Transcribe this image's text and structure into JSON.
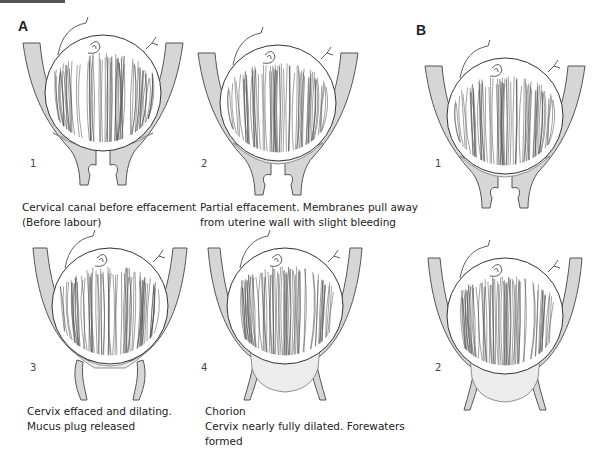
{
  "panels": {
    "A": {
      "label": "A",
      "stages": [
        {
          "number": "1",
          "caption": [
            "Cervical canal before effacement",
            "(Before labour)"
          ]
        },
        {
          "number": "2",
          "caption": [
            "Partial effacement. Membranes pull away",
            "from uterine wall with slight bleeding"
          ]
        },
        {
          "number": "3",
          "caption": [
            "Cervix effaced and dilating.",
            "Mucus plug released"
          ]
        },
        {
          "number": "4",
          "caption": [
            "Chorion",
            "Cervix nearly fully dilated. Forewaters",
            "formed"
          ]
        }
      ]
    },
    "B": {
      "label": "B",
      "stages": [
        {
          "number": "1"
        },
        {
          "number": "2"
        }
      ]
    }
  },
  "colors": {
    "wall": "#d6d6d6",
    "outline": "#555555",
    "forewaters": "#ececec"
  }
}
